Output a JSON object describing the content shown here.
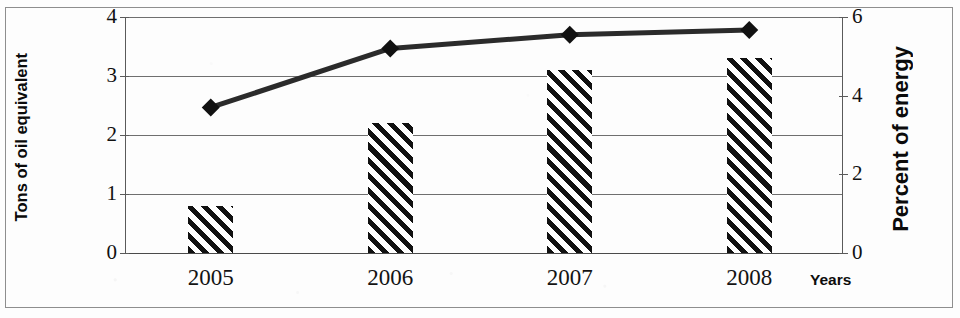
{
  "chart_data": {
    "type": "bar",
    "title": "",
    "subtitle": "",
    "categories": [
      "2005",
      "2006",
      "2007",
      "2008"
    ],
    "xlabel": "Years",
    "grid": true,
    "legend": "none",
    "series": [
      {
        "name": "Tons of oil equivalent",
        "type": "bar",
        "axis": "left",
        "style": "diagonal-hatch",
        "values": [
          0.8,
          2.2,
          3.1,
          3.3
        ]
      },
      {
        "name": "Percent of energy",
        "type": "line",
        "axis": "right",
        "marker": "diamond",
        "values": [
          3.7,
          5.2,
          5.55,
          5.67
        ]
      }
    ],
    "left_axis": {
      "label": "Tons of oil equivalent",
      "ticks": [
        "0",
        "1",
        "2",
        "3",
        "4"
      ],
      "tick_values": [
        0,
        1,
        2,
        3,
        4
      ],
      "ylim": [
        0,
        4
      ]
    },
    "right_axis": {
      "label": "Percent of energy",
      "ticks": [
        "0",
        "2",
        "4",
        "6"
      ],
      "tick_values": [
        0,
        2,
        4,
        6
      ],
      "ylim": [
        0,
        6
      ]
    },
    "colors": {
      "bar_hatch": "#111111",
      "bar_background": "#ffffff",
      "line": "#2b2b2b",
      "marker": "#111111",
      "gridline": "#6f6f6f",
      "axis": "#5a5a5a",
      "text": "#111111",
      "border": "#8e8e8e"
    }
  }
}
